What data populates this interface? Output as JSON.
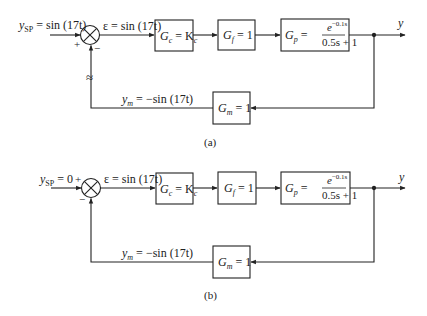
{
  "diagrams": [
    {
      "id": "a",
      "caption": "(a)",
      "setpoint_label": "y_SP = sin (17t)",
      "setpoint_var": "y",
      "setpoint_sub": "SP",
      "setpoint_rhs": " = sin (17t)",
      "plus_sign": "+",
      "minus_sign": "−",
      "error_label": "ε = sin (17t)",
      "controller": {
        "name": "G",
        "sub": "c",
        "rhs": " = K",
        "rhs_sub": "c"
      },
      "final_element": {
        "name": "G",
        "sub": "f",
        "rhs": " = 1"
      },
      "process": {
        "name": "G",
        "sub": "p",
        "eq": " = ",
        "num": "e",
        "num_exp": "−0.1s",
        "den": "0.5s + 1"
      },
      "output_label": "y",
      "measurement": {
        "name": "G",
        "sub": "m",
        "rhs": " = 1"
      },
      "feedback_label_var": "y",
      "feedback_label_sub": "m",
      "feedback_label_rhs": " = −sin (17t)",
      "approx_symbol": "≈"
    },
    {
      "id": "b",
      "caption": "(b)",
      "setpoint_var": "y",
      "setpoint_sub": "SP",
      "setpoint_rhs": " = 0",
      "plus_sign": "+",
      "minus_sign": "−",
      "error_label": "ε = sin (17t)",
      "controller": {
        "name": "G",
        "sub": "c",
        "rhs": " = K",
        "rhs_sub": "c"
      },
      "final_element": {
        "name": "G",
        "sub": "f",
        "rhs": " = 1"
      },
      "process": {
        "name": "G",
        "sub": "p",
        "eq": " = ",
        "num": "e",
        "num_exp": "−0.1s",
        "den": "0.5s + 1"
      },
      "output_label": "y",
      "measurement": {
        "name": "G",
        "sub": "m",
        "rhs": " = 1"
      },
      "feedback_label_var": "y",
      "feedback_label_sub": "m",
      "feedback_label_rhs": " = −sin (17t)"
    }
  ]
}
